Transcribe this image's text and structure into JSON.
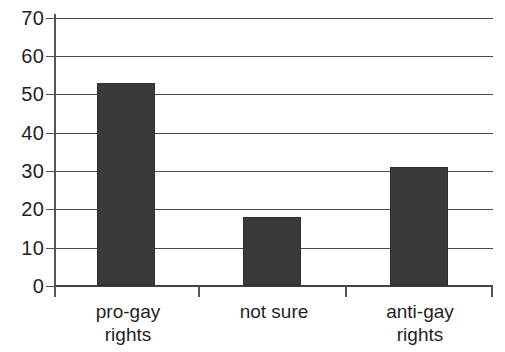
{
  "chart_data": {
    "type": "bar",
    "title": "",
    "subtitle": "",
    "xlabel": "",
    "ylabel": "",
    "categories": [
      "pro-gay rights",
      "not sure",
      "anti-gay rights"
    ],
    "category_lines": [
      [
        "pro-gay",
        "rights"
      ],
      [
        "not sure"
      ],
      [
        "anti-gay",
        "rights"
      ]
    ],
    "values": [
      53,
      18,
      31
    ],
    "ylim": [
      0,
      70
    ],
    "ytick_labels": [
      "70",
      "60",
      "50",
      "40",
      "30",
      "20",
      "10",
      "0"
    ],
    "ytick_values": [
      70,
      60,
      50,
      40,
      30,
      20,
      10,
      0
    ],
    "ystep": 10,
    "grid": true,
    "grid_axis": "y",
    "legend": "none",
    "bar_color": "#3a3a3a",
    "grid_color": "#4a4a4a",
    "axis_color": "#555555",
    "background_color": "#ffffff",
    "text_color": "#1f1f1f"
  }
}
